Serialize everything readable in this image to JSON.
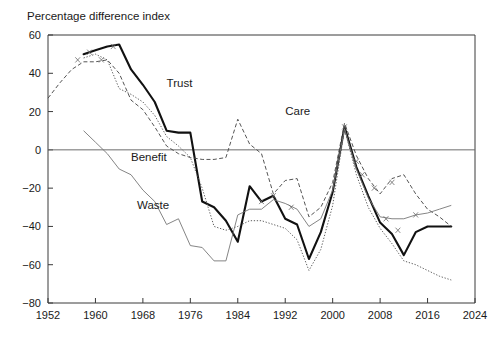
{
  "chart_data": {
    "type": "line",
    "title": "",
    "ylabel": "Percentage difference index",
    "xlabel": "",
    "xlim": [
      1952,
      2024
    ],
    "ylim": [
      -80,
      60
    ],
    "grid": false,
    "legend_position": "inline-annotations",
    "yticks": [
      -80,
      -60,
      -40,
      -20,
      0,
      20,
      40,
      60
    ],
    "ytick_labels": [
      "−80",
      "−60",
      "−40",
      "−20",
      "0",
      "20",
      "40",
      "60"
    ],
    "xticks": [
      1952,
      1960,
      1968,
      1976,
      1984,
      1992,
      2000,
      2008,
      2016,
      2024
    ],
    "xtick_labels": [
      "1952",
      "1960",
      "1968",
      "1976",
      "1984",
      "1992",
      "2000",
      "2008",
      "2016",
      "2024"
    ],
    "zero_reference_line": 0,
    "annotations": [
      {
        "text": "Trust",
        "x": 1972,
        "y": 33
      },
      {
        "text": "Care",
        "x": 1992,
        "y": 18
      },
      {
        "text": "Benefit",
        "x": 1966,
        "y": -6
      },
      {
        "text": "Waste",
        "x": 1967,
        "y": -31
      }
    ],
    "series": [
      {
        "name": "Trust",
        "style": "thick-solid",
        "color": "#111111",
        "x": [
          1958,
          1960,
          1962,
          1964,
          1966,
          1968,
          1970,
          1972,
          1974,
          1976,
          1978,
          1980,
          1982,
          1984,
          1986,
          1988,
          1990,
          1992,
          1994,
          1996,
          1998,
          2000,
          2002,
          2004,
          2006,
          2008,
          2010,
          2012,
          2014,
          2016,
          2018,
          2020
        ],
        "values": [
          50,
          52,
          54,
          55,
          42,
          34,
          25,
          10,
          9,
          9,
          -27,
          -30,
          -37,
          -48,
          -19,
          -27,
          -24,
          -36,
          -39,
          -57,
          -43,
          -22,
          12,
          -9,
          -24,
          -38,
          -44,
          -55,
          -43,
          -40,
          -40,
          -40
        ]
      },
      {
        "name": "Care",
        "style": "dashed",
        "color": "#4c4c4c",
        "x": [
          1952,
          1954,
          1956,
          1958,
          1960,
          1962,
          1964,
          1966,
          1968,
          1970,
          1972,
          1974,
          1976,
          1978,
          1980,
          1982,
          1984,
          1986,
          1988,
          1990,
          1992,
          1994,
          1996,
          1998,
          2000,
          2002,
          2004,
          2006,
          2008,
          2010,
          2012,
          2014,
          2016,
          2018,
          2020
        ],
        "values": [
          27,
          35,
          42,
          46,
          46,
          47,
          40,
          26,
          21,
          12,
          2,
          -2,
          -4,
          -5,
          -5,
          -4,
          16,
          3,
          -2,
          -23,
          -16,
          -15,
          -35,
          -30,
          -17,
          14,
          -3,
          -15,
          -23,
          -15,
          -13,
          -23,
          -31,
          -35,
          -40
        ]
      },
      {
        "name": "Benefit",
        "style": "dotted",
        "color": "#555555",
        "x": [
          1958,
          1960,
          1962,
          1964,
          1966,
          1968,
          1970,
          1972,
          1974,
          1976,
          1978,
          1980,
          1982,
          1984,
          1986,
          1988,
          1990,
          1992,
          1994,
          1996,
          1998,
          2000,
          2002,
          2004,
          2006,
          2008,
          2010,
          2012,
          2014,
          2016,
          2018,
          2020
        ],
        "values": [
          48,
          50,
          47,
          32,
          29,
          25,
          18,
          7,
          2,
          -4,
          -20,
          -40,
          -42,
          -40,
          -37,
          -37,
          -39,
          -41,
          -47,
          -63,
          -52,
          -29,
          11,
          -13,
          -30,
          -41,
          -49,
          -58,
          -60,
          -63,
          -66,
          -68
        ]
      },
      {
        "name": "Waste",
        "style": "thin-solid",
        "color": "#777777",
        "x": [
          1958,
          1960,
          1962,
          1964,
          1966,
          1968,
          1970,
          1972,
          1974,
          1976,
          1978,
          1980,
          1982,
          1984,
          1986,
          1988,
          1990,
          1992,
          1994,
          1996,
          1998,
          2000,
          2002,
          2004,
          2006,
          2008,
          2010,
          2012,
          2014,
          2016,
          2018,
          2020
        ],
        "values": [
          10,
          4,
          -2,
          -10,
          -13,
          -21,
          -27,
          -39,
          -36,
          -50,
          -51,
          -58,
          -58,
          -34,
          -31,
          -31,
          -26,
          -28,
          -31,
          -40,
          -36,
          -21,
          11,
          -10,
          -25,
          -35,
          -36,
          -36,
          -34,
          -33,
          -31,
          -29
        ]
      }
    ]
  }
}
